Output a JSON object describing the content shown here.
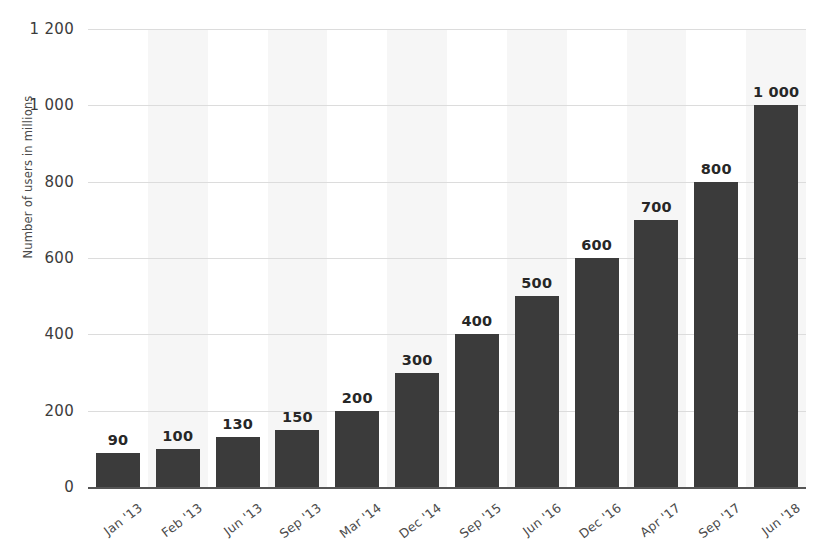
{
  "chart_data": {
    "type": "bar",
    "title": "",
    "xlabel": "",
    "ylabel": "Number of users in millions",
    "ylim": [
      0,
      1200
    ],
    "yticks": [
      "0",
      "200",
      "400",
      "600",
      "800",
      "1 000",
      "1 200"
    ],
    "ytick_values": [
      0,
      200,
      400,
      600,
      800,
      1000,
      1200
    ],
    "grid": true,
    "legend": "none",
    "bar_color": "#3b3b3b",
    "band_color": "#f6f6f6",
    "gridline_color": "#dcdcdc",
    "axis_color": "#555555",
    "categories": [
      "Jan '13",
      "Feb '13",
      "Jun '13",
      "Sep '13",
      "Mar '14",
      "Dec '14",
      "Sep '15",
      "Jun '16",
      "Dec '16",
      "Apr '17",
      "Sep '17",
      "Jun '18"
    ],
    "values": [
      90,
      100,
      130,
      150,
      200,
      300,
      400,
      500,
      600,
      700,
      800,
      1000
    ],
    "value_labels": [
      "90",
      "100",
      "130",
      "150",
      "200",
      "300",
      "400",
      "500",
      "600",
      "700",
      "800",
      "1 000"
    ]
  }
}
